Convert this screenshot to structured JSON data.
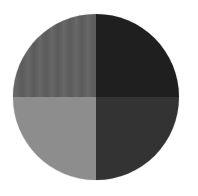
{
  "figure": {
    "shape": "circle",
    "quadrants": [
      {
        "position": "top-left",
        "color": "#606060",
        "texture": "faint vertical stripes"
      },
      {
        "position": "top-right",
        "color": "#1f1f1f",
        "texture": "solid"
      },
      {
        "position": "bottom-left",
        "color": "#8d8d8d",
        "texture": "solid"
      },
      {
        "position": "bottom-right",
        "color": "#333333",
        "texture": "solid"
      }
    ]
  }
}
